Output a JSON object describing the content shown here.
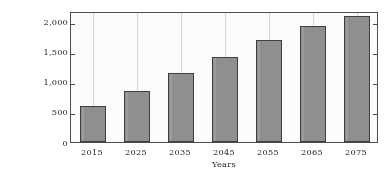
{
  "chart_data": {
    "type": "bar",
    "title": "",
    "xlabel": "Years",
    "ylabel": "Population aged 65+ (Million)",
    "categories": [
      "2015",
      "2025",
      "2035",
      "2045",
      "2055",
      "2065",
      "2075"
    ],
    "values": [
      600,
      850,
      1150,
      1420,
      1700,
      1930,
      2100
    ],
    "ytick_labels": [
      "0",
      "500",
      "1,000",
      "1,500",
      "2,000"
    ],
    "ytick_values": [
      0,
      500,
      1000,
      1500,
      2000
    ],
    "ylim": [
      0,
      2180
    ],
    "grid": "vertical-category-lines",
    "legend": "none",
    "bar_color": "#8f8f8f",
    "bar_border_color": "#3d3d3d",
    "axis_color": "#4a4a4a",
    "gridline_color": "#d9d9d9"
  },
  "caption": {
    "text": ""
  }
}
